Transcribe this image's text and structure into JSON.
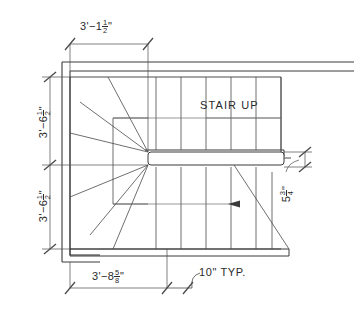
{
  "drawing": {
    "title": "Stair Plan — Winder Stair",
    "type": "architectural-floor-plan",
    "line_color": "#3a3a3a",
    "text_color": "#2b2b2b",
    "background": "#ffffff"
  },
  "labels": {
    "stair_up": "STAIR  UP",
    "tread_typ": "10\"  TYP."
  },
  "dimensions": {
    "top": {
      "name": "overall-width-upper",
      "feet": "3'",
      "dash": "−",
      "inches": "1",
      "frac_num": "1",
      "frac_den": "2",
      "unit": "\"",
      "plain": "3'-1 1/2\""
    },
    "left_upper": {
      "name": "left-run-upper",
      "feet": "3'",
      "dash": "−",
      "inches": "6",
      "frac_num": "1",
      "frac_den": "2",
      "unit": "\"",
      "plain": "3'-6 1/2\""
    },
    "left_lower": {
      "name": "left-run-lower",
      "feet": "3'",
      "dash": "−",
      "inches": "6",
      "frac_num": "1",
      "frac_den": "2",
      "unit": "\"",
      "plain": "3'-6 1/2\""
    },
    "bottom": {
      "name": "overall-width-lower",
      "feet": "3'",
      "dash": "−",
      "inches": "8",
      "frac_num": "5",
      "frac_den": "8",
      "unit": "\"",
      "plain": "3'-8 5/8\""
    },
    "right": {
      "name": "landing-depth-right",
      "feet": "",
      "dash": "",
      "inches": "5",
      "frac_num": "3",
      "frac_den": "4",
      "unit": "\"",
      "plain": "5 3/4\""
    }
  },
  "notes": {
    "tread_callout": "10\"  TYP.",
    "direction_arrow": "up-direction-arrow"
  }
}
